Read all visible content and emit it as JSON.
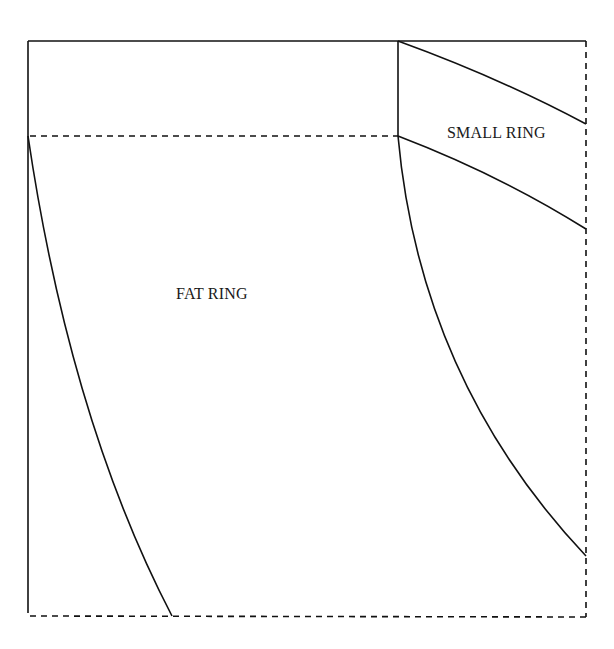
{
  "diagram": {
    "type": "sewing-pattern",
    "labels": {
      "fat_ring": "FAT RING",
      "small_ring": "SMALL RING"
    },
    "colors": {
      "line": "#111111",
      "background": "#ffffff"
    },
    "line_styles": {
      "solid": "cut line",
      "dashed": "fold line"
    }
  }
}
